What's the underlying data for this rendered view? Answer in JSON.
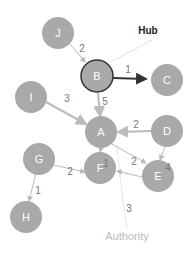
{
  "annotations": {
    "hub": "Hub",
    "authority": "Authority"
  },
  "nodes": {
    "A": "A",
    "B": "B",
    "C": "C",
    "D": "D",
    "E": "E",
    "F": "F",
    "G": "G",
    "H": "H",
    "I": "I",
    "J": "J"
  },
  "edges": [
    {
      "from": "J",
      "to": "B",
      "weight": "2"
    },
    {
      "from": "B",
      "to": "C",
      "weight": "1"
    },
    {
      "from": "I",
      "to": "A",
      "weight": "3"
    },
    {
      "from": "B",
      "to": "A",
      "weight": "5"
    },
    {
      "from": "D",
      "to": "A",
      "weight": "2"
    },
    {
      "from": "A",
      "to": "F",
      "weight": "1"
    },
    {
      "from": "A",
      "to": "E",
      "weight": "2"
    },
    {
      "from": "D",
      "to": "E",
      "weight": "4"
    },
    {
      "from": "G",
      "to": "F",
      "weight": "2"
    },
    {
      "from": "G",
      "to": "H",
      "weight": "1"
    },
    {
      "from": "E",
      "to": "F",
      "weight": "3"
    }
  ]
}
